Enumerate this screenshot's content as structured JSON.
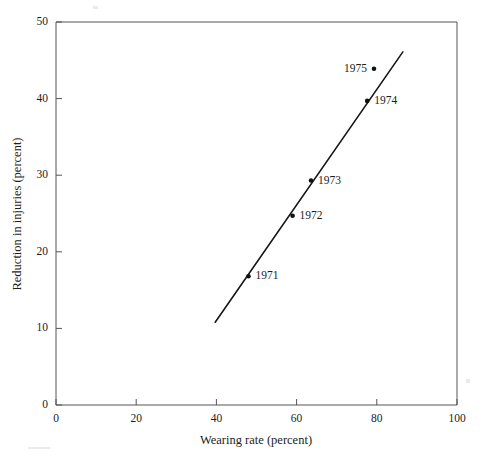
{
  "chart_data": {
    "type": "scatter",
    "title": "",
    "xlabel": "Wearing rate (percent)",
    "ylabel": "Reduction in injuries (percent)",
    "xlim": [
      0,
      100
    ],
    "ylim": [
      0,
      50
    ],
    "xticks": [
      0,
      20,
      40,
      60,
      80,
      100
    ],
    "yticks": [
      0,
      10,
      20,
      30,
      40,
      50
    ],
    "xtick_labels": [
      "0",
      "20",
      "40",
      "60",
      "80",
      "100"
    ],
    "ytick_labels": [
      "0",
      "10",
      "20",
      "30",
      "40",
      "50"
    ],
    "grid": false,
    "legend": "none",
    "series": [
      {
        "name": "Annual observations",
        "points": [
          {
            "label": "1971",
            "x": 48.0,
            "y": 16.8,
            "label_side": "right"
          },
          {
            "label": "1972",
            "x": 59.0,
            "y": 24.7,
            "label_side": "right"
          },
          {
            "label": "1973",
            "x": 63.6,
            "y": 29.3,
            "label_side": "right"
          },
          {
            "label": "1974",
            "x": 77.6,
            "y": 39.7,
            "label_side": "right"
          },
          {
            "label": "1975",
            "x": 79.3,
            "y": 43.9,
            "label_side": "left"
          }
        ]
      }
    ],
    "trend_line": {
      "name": "Fitted line",
      "x_start": 39.7,
      "y_start": 10.8,
      "x_end": 86.5,
      "y_end": 46.1
    },
    "annotations": [
      "1971",
      "1972",
      "1973",
      "1974",
      "1975"
    ]
  }
}
